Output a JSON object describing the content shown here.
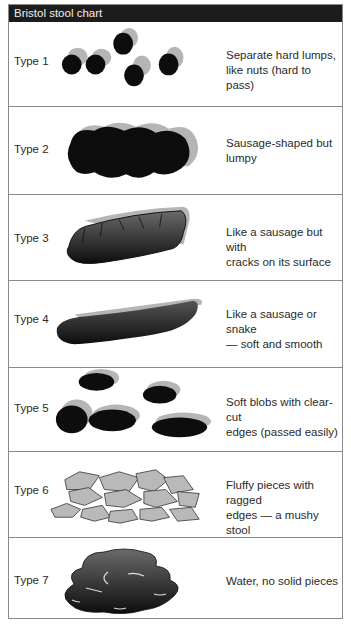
{
  "title": "Bristol stool chart",
  "rows": [
    {
      "type": "Type 1",
      "description_line1": "Separate hard lumps,",
      "description_line2": "like nuts (hard to pass)",
      "icon": "separate-hard-lumps-illustration"
    },
    {
      "type": "Type 2",
      "description_line1": "Sausage-shaped but",
      "description_line2": "lumpy",
      "icon": "lumpy-sausage-illustration"
    },
    {
      "type": "Type 3",
      "description_line1": "Like a sausage but with",
      "description_line2": "cracks on its surface",
      "icon": "cracked-sausage-illustration"
    },
    {
      "type": "Type 4",
      "description_line1": "Like a sausage or snake",
      "description_line2": "— soft and smooth",
      "icon": "smooth-snake-illustration"
    },
    {
      "type": "Type 5",
      "description_line1": "Soft blobs with clear-cut",
      "description_line2": "edges (passed easily)",
      "icon": "soft-blobs-illustration"
    },
    {
      "type": "Type 6",
      "description_line1": "Fluffy pieces with ragged",
      "description_line2": "edges — a mushy stool",
      "icon": "fluffy-pieces-illustration"
    },
    {
      "type": "Type 7",
      "description_line1": "Water, no solid pieces",
      "description_line2": "",
      "icon": "watery-illustration"
    }
  ],
  "colors": {
    "header_bg": "#1c1c1c",
    "header_text": "#f0f0f0",
    "border": "#8a8a8a",
    "shape_dark": "#0d0d0d",
    "shape_shadow": "#b5b5b5",
    "shape_light": "#b9b9b9"
  }
}
